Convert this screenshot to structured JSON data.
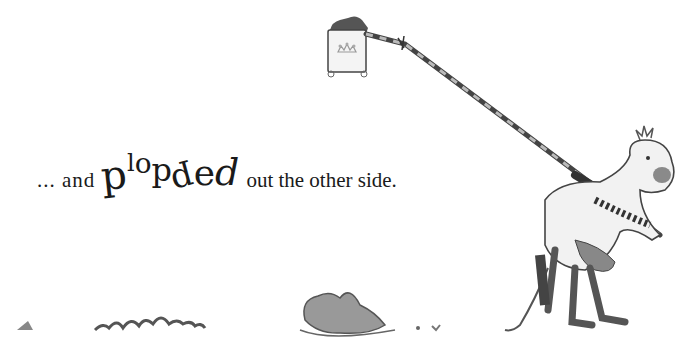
{
  "page": {
    "caption": {
      "lead": "... and",
      "emphasis_letters": [
        "p",
        "l",
        "o",
        "p",
        "p",
        "e",
        "d"
      ],
      "tail": "out the other side."
    },
    "illustrations": [
      {
        "name": "crown-flag-banner",
        "description": "square banner with crown emblem on top of a striped lance"
      },
      {
        "name": "striped-lance",
        "description": "long striped lance held by knight"
      },
      {
        "name": "knight-on-pantomime-horse",
        "description": "knight carrying a horse costume"
      },
      {
        "name": "ground-debris",
        "description": "scattered scraps and crumpled fabric on the ground"
      }
    ],
    "colors": {
      "background": "#ffffff",
      "ink": "#1a1a1a",
      "shade": "#8a8a8a"
    }
  }
}
